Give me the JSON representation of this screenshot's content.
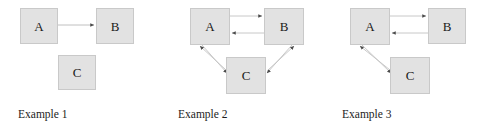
{
  "figure": {
    "background_color": "#ffffff",
    "node_fill_color": "#e2e2e2",
    "node_border_color": "#c9c9c9",
    "edge_color": "#b5b5b5",
    "arrowhead_color": "#4a4a4a",
    "label_color": "#1a1a1a"
  },
  "examples": [
    {
      "caption": "Example 1",
      "nodes": [
        {
          "id": "A",
          "label": "A",
          "x": 20,
          "y": 8,
          "w": 38,
          "h": 36
        },
        {
          "id": "B",
          "label": "B",
          "x": 96,
          "y": 8,
          "w": 38,
          "h": 36
        },
        {
          "id": "C",
          "label": "C",
          "x": 58,
          "y": 55,
          "w": 38,
          "h": 35
        }
      ],
      "edges": [
        {
          "from": "A",
          "to": "B",
          "directed": true,
          "x1": 58,
          "y1": 25,
          "x2": 96,
          "y2": 25
        }
      ]
    },
    {
      "caption": "Example 2",
      "nodes": [
        {
          "id": "A",
          "label": "A",
          "x": 26,
          "y": 8,
          "w": 40,
          "h": 37
        },
        {
          "id": "B",
          "label": "B",
          "x": 100,
          "y": 8,
          "w": 40,
          "h": 37
        },
        {
          "id": "C",
          "label": "C",
          "x": 62,
          "y": 57,
          "w": 40,
          "h": 37
        }
      ],
      "edges": [
        {
          "from": "A",
          "to": "B",
          "directed": true,
          "x1": 66,
          "y1": 16,
          "x2": 100,
          "y2": 16
        },
        {
          "from": "B",
          "to": "A",
          "directed": true,
          "x1": 100,
          "y1": 33,
          "x2": 66,
          "y2": 33
        },
        {
          "from": "A",
          "to": "C",
          "directed": true,
          "x1": 38,
          "y1": 45,
          "x2": 64,
          "y2": 74
        },
        {
          "from": "C",
          "to": "A",
          "directed": true,
          "x1": 62,
          "y1": 70,
          "x2": 35,
          "y2": 45
        },
        {
          "from": "B",
          "to": "C",
          "directed": true,
          "x1": 128,
          "y1": 45,
          "x2": 102,
          "y2": 74
        },
        {
          "from": "C",
          "to": "B",
          "directed": true,
          "x1": 102,
          "y1": 70,
          "x2": 131,
          "y2": 45
        }
      ]
    },
    {
      "caption": "Example 3",
      "nodes": [
        {
          "id": "A",
          "label": "A",
          "x": 22,
          "y": 8,
          "w": 40,
          "h": 37
        },
        {
          "id": "B",
          "label": "B",
          "x": 100,
          "y": 8,
          "w": 38,
          "h": 36
        },
        {
          "id": "C",
          "label": "C",
          "x": 62,
          "y": 57,
          "w": 40,
          "h": 37
        }
      ],
      "edges": [
        {
          "from": "A",
          "to": "B",
          "directed": true,
          "x1": 62,
          "y1": 16,
          "x2": 100,
          "y2": 16
        },
        {
          "from": "B",
          "to": "A",
          "directed": true,
          "x1": 100,
          "y1": 33,
          "x2": 62,
          "y2": 33
        },
        {
          "from": "A",
          "to": "C",
          "directed": true,
          "x1": 34,
          "y1": 45,
          "x2": 64,
          "y2": 74
        },
        {
          "from": "C",
          "to": "A",
          "directed": true,
          "x1": 62,
          "y1": 70,
          "x2": 31,
          "y2": 45
        }
      ]
    }
  ]
}
